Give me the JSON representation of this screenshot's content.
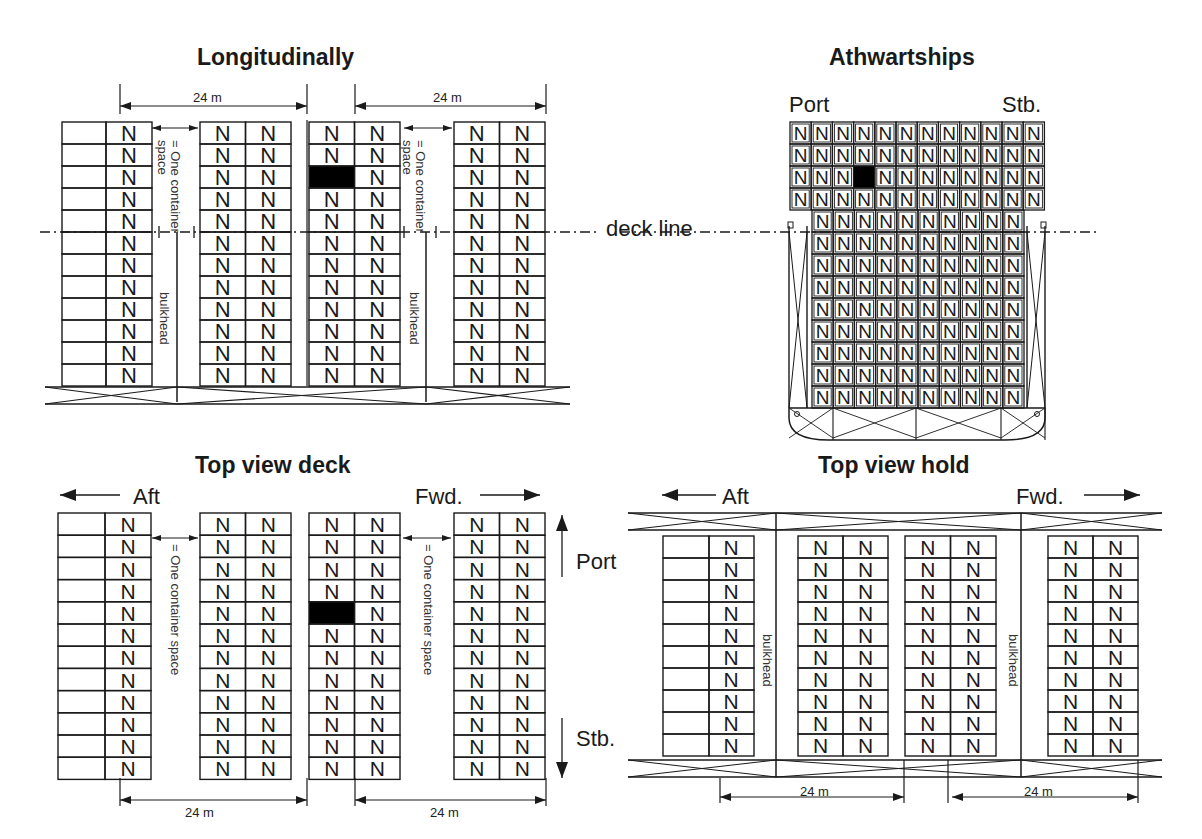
{
  "titles": {
    "longitudinally": "Longitudinally",
    "athwartships": "Athwartships",
    "top_view_deck": "Top view deck",
    "top_view_hold": "Top view hold"
  },
  "labels": {
    "port": "Port",
    "stb": "Stb.",
    "aft": "Aft",
    "fwd": "Fwd.",
    "deck_line": "deck line",
    "bulkhead": "bulkhead",
    "one_container_space": "= One container space",
    "one_container_space_line1": "= One container",
    "one_container_space_line2": "space",
    "dimension": "24 m"
  },
  "container_glyph": "N",
  "colors": {
    "line": "#1a1a1a",
    "occupied": "#000000",
    "background": "#ffffff"
  },
  "longitudinal": {
    "rows_above_deck": 5,
    "rows_below_deck": 7,
    "bays": [
      {
        "x": 62,
        "cols": 2,
        "first_col_empty": true
      },
      {
        "x": 200,
        "cols": 2
      },
      {
        "x": 309,
        "cols": 2,
        "blocked": {
          "row": 2,
          "col": 0
        }
      },
      {
        "x": 454,
        "cols": 2
      }
    ]
  },
  "athwartships": {
    "deck_cols": 12,
    "deck_rows": 4,
    "hold_cols": 10,
    "hold_rows": 9,
    "blocked": {
      "row": 2,
      "col": 3
    }
  },
  "top_view_deck": {
    "rows": 12,
    "bays": [
      {
        "x": 58,
        "cols": 2,
        "first_col_empty": true
      },
      {
        "x": 200,
        "cols": 2
      },
      {
        "x": 309,
        "cols": 2,
        "blocked": {
          "row": 4,
          "col": 0
        }
      },
      {
        "x": 454,
        "cols": 2
      }
    ]
  },
  "top_view_hold": {
    "rows": 10,
    "bays": [
      {
        "x": 663,
        "cols": 2,
        "first_col_empty": true
      },
      {
        "x": 798,
        "cols": 2
      },
      {
        "x": 905,
        "cols": 2
      },
      {
        "x": 1048,
        "cols": 2
      }
    ]
  }
}
